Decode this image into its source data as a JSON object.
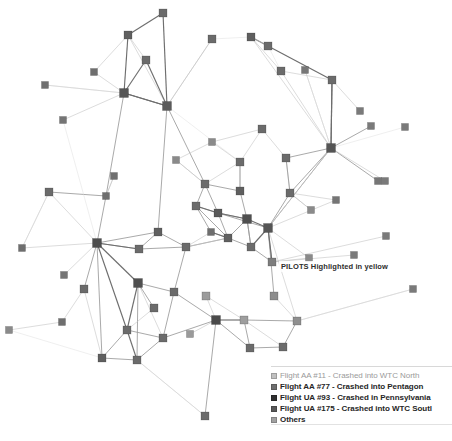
{
  "diagram": {
    "type": "node-link-network",
    "annotation": {
      "text": "PILOTS Highlighted in yellow",
      "x": 279,
      "y": 261
    },
    "node_shape": "square",
    "node_size": 7,
    "background": "#ffffff",
    "edge_colors": {
      "dark": "#6e6e6e",
      "medium": "#9a9a9a",
      "light": "#c4c4c4",
      "faint": "#dcdcdc"
    },
    "node_colors": {
      "aa11": "#b9b9b9",
      "aa77": "#6b6b6b",
      "ua93": "#3a3a3a",
      "ua175": "#555555",
      "others": "#a8a8a8",
      "pilot": "#7d7d7d"
    }
  },
  "legend": {
    "items": [
      {
        "label": "Flight AA #11 - Crashed into WTC North",
        "color": "#c0c0c0",
        "emphasis": "faint",
        "swatch_name": "legend-swatch-aa11"
      },
      {
        "label": "Flight AA #77 - Crashed into Pentagon",
        "color": "#6e6e6e",
        "emphasis": "bold",
        "swatch_name": "legend-swatch-aa77"
      },
      {
        "label": "Flight UA #93 - Crashed in Pennsylvania",
        "color": "#303030",
        "emphasis": "bold",
        "swatch_name": "legend-swatch-ua93"
      },
      {
        "label": "Flight UA #175 - Crashed into WTC Soutl",
        "color": "#585858",
        "emphasis": "bold",
        "swatch_name": "legend-swatch-ua175"
      },
      {
        "label": "Others",
        "color": "#a0a0a0",
        "emphasis": "bold",
        "swatch_name": "legend-swatch-others"
      }
    ]
  },
  "chart_data": {
    "type": "network",
    "nodes": [
      {
        "id": 0,
        "x": 163,
        "y": 13,
        "c": "#6b6b6b",
        "s": 8
      },
      {
        "id": 1,
        "x": 128,
        "y": 35,
        "c": "#5f5f5f",
        "s": 8
      },
      {
        "id": 2,
        "x": 146,
        "y": 60,
        "c": "#6b6b6b",
        "s": 8
      },
      {
        "id": 3,
        "x": 94,
        "y": 72,
        "c": "#6e6e6e",
        "s": 7
      },
      {
        "id": 4,
        "x": 124,
        "y": 93,
        "c": "#555555",
        "s": 9
      },
      {
        "id": 5,
        "x": 167,
        "y": 106,
        "c": "#5a5a5a",
        "s": 9
      },
      {
        "id": 6,
        "x": 45,
        "y": 85,
        "c": "#707070",
        "s": 7
      },
      {
        "id": 7,
        "x": 63,
        "y": 120,
        "c": "#757575",
        "s": 7
      },
      {
        "id": 8,
        "x": 212,
        "y": 39,
        "c": "#6b6b6b",
        "s": 8
      },
      {
        "id": 9,
        "x": 251,
        "y": 37,
        "c": "#5f5f5f",
        "s": 8
      },
      {
        "id": 10,
        "x": 268,
        "y": 46,
        "c": "#6b6b6b",
        "s": 8
      },
      {
        "id": 11,
        "x": 281,
        "y": 71,
        "c": "#6b6b6b",
        "s": 8
      },
      {
        "id": 12,
        "x": 305,
        "y": 70,
        "c": "#777777",
        "s": 7
      },
      {
        "id": 13,
        "x": 332,
        "y": 80,
        "c": "#6b6b6b",
        "s": 8
      },
      {
        "id": 14,
        "x": 331,
        "y": 148,
        "c": "#555555",
        "s": 9
      },
      {
        "id": 15,
        "x": 286,
        "y": 158,
        "c": "#6b6b6b",
        "s": 8
      },
      {
        "id": 16,
        "x": 371,
        "y": 126,
        "c": "#7a7a7a",
        "s": 7
      },
      {
        "id": 17,
        "x": 405,
        "y": 127,
        "c": "#7a7a7a",
        "s": 7
      },
      {
        "id": 18,
        "x": 378,
        "y": 181,
        "c": "#767676",
        "s": 7
      },
      {
        "id": 19,
        "x": 290,
        "y": 193,
        "c": "#6b6b6b",
        "s": 8
      },
      {
        "id": 20,
        "x": 336,
        "y": 200,
        "c": "#757575",
        "s": 7
      },
      {
        "id": 21,
        "x": 240,
        "y": 191,
        "c": "#5f5f5f",
        "s": 8
      },
      {
        "id": 22,
        "x": 205,
        "y": 184,
        "c": "#6b6b6b",
        "s": 8
      },
      {
        "id": 23,
        "x": 218,
        "y": 213,
        "c": "#5a5a5a",
        "s": 8
      },
      {
        "id": 24,
        "x": 196,
        "y": 206,
        "c": "#6b6b6b",
        "s": 8
      },
      {
        "id": 25,
        "x": 247,
        "y": 219,
        "c": "#4f4f4f",
        "s": 9
      },
      {
        "id": 26,
        "x": 268,
        "y": 228,
        "c": "#555555",
        "s": 9
      },
      {
        "id": 27,
        "x": 228,
        "y": 238,
        "c": "#606060",
        "s": 8
      },
      {
        "id": 28,
        "x": 251,
        "y": 247,
        "c": "#6b6b6b",
        "s": 8
      },
      {
        "id": 29,
        "x": 272,
        "y": 262,
        "c": "#7d7d7d",
        "s": 8
      },
      {
        "id": 30,
        "x": 211,
        "y": 232,
        "c": "#6e6e6e",
        "s": 7
      },
      {
        "id": 31,
        "x": 186,
        "y": 247,
        "c": "#6b6b6b",
        "s": 8
      },
      {
        "id": 32,
        "x": 158,
        "y": 232,
        "c": "#5f5f5f",
        "s": 8
      },
      {
        "id": 33,
        "x": 139,
        "y": 249,
        "c": "#6b6b6b",
        "s": 8
      },
      {
        "id": 34,
        "x": 106,
        "y": 196,
        "c": "#6e6e6e",
        "s": 7
      },
      {
        "id": 35,
        "x": 49,
        "y": 192,
        "c": "#6b6b6b",
        "s": 8
      },
      {
        "id": 36,
        "x": 22,
        "y": 248,
        "c": "#6e6e6e",
        "s": 7
      },
      {
        "id": 37,
        "x": 64,
        "y": 275,
        "c": "#757575",
        "s": 7
      },
      {
        "id": 38,
        "x": 97,
        "y": 243,
        "c": "#4d4d4d",
        "s": 9
      },
      {
        "id": 39,
        "x": 138,
        "y": 283,
        "c": "#4f4f4f",
        "s": 9
      },
      {
        "id": 40,
        "x": 174,
        "y": 292,
        "c": "#6b6b6b",
        "s": 8
      },
      {
        "id": 41,
        "x": 9,
        "y": 330,
        "c": "#8a8a8a",
        "s": 7
      },
      {
        "id": 42,
        "x": 127,
        "y": 330,
        "c": "#6b6b6b",
        "s": 8
      },
      {
        "id": 43,
        "x": 102,
        "y": 358,
        "c": "#5f5f5f",
        "s": 8
      },
      {
        "id": 44,
        "x": 137,
        "y": 360,
        "c": "#6b6b6b",
        "s": 8
      },
      {
        "id": 45,
        "x": 163,
        "y": 338,
        "c": "#6b6b6b",
        "s": 8
      },
      {
        "id": 46,
        "x": 206,
        "y": 296,
        "c": "#9c9c9c",
        "s": 8
      },
      {
        "id": 47,
        "x": 216,
        "y": 320,
        "c": "#4a4a4a",
        "s": 9
      },
      {
        "id": 48,
        "x": 244,
        "y": 320,
        "c": "#9e9e9e",
        "s": 8
      },
      {
        "id": 49,
        "x": 274,
        "y": 296,
        "c": "#8d8d8d",
        "s": 8
      },
      {
        "id": 50,
        "x": 250,
        "y": 348,
        "c": "#6b6b6b",
        "s": 8
      },
      {
        "id": 51,
        "x": 283,
        "y": 347,
        "c": "#6b6b6b",
        "s": 8
      },
      {
        "id": 52,
        "x": 297,
        "y": 321,
        "c": "#8f8f8f",
        "s": 8
      },
      {
        "id": 53,
        "x": 205,
        "y": 416,
        "c": "#6b6b6b",
        "s": 8
      },
      {
        "id": 54,
        "x": 154,
        "y": 308,
        "c": "#6b6b6b",
        "s": 8
      },
      {
        "id": 55,
        "x": 62,
        "y": 322,
        "c": "#6e6e6e",
        "s": 7
      },
      {
        "id": 56,
        "x": 114,
        "y": 176,
        "c": "#707070",
        "s": 7
      },
      {
        "id": 57,
        "x": 386,
        "y": 236,
        "c": "#7a7a7a",
        "s": 7
      },
      {
        "id": 58,
        "x": 354,
        "y": 255,
        "c": "#7a7a7a",
        "s": 7
      },
      {
        "id": 59,
        "x": 309,
        "y": 258,
        "c": "#8a8a8a",
        "s": 7
      },
      {
        "id": 60,
        "x": 413,
        "y": 289,
        "c": "#7a7a7a",
        "s": 7
      },
      {
        "id": 61,
        "x": 385,
        "y": 181,
        "c": "#7a7a7a",
        "s": 7
      },
      {
        "id": 62,
        "x": 240,
        "y": 162,
        "c": "#6b6b6b",
        "s": 8
      },
      {
        "id": 63,
        "x": 262,
        "y": 129,
        "c": "#6b6b6b",
        "s": 8
      },
      {
        "id": 64,
        "x": 212,
        "y": 142,
        "c": "#8a8a8a",
        "s": 7
      },
      {
        "id": 65,
        "x": 176,
        "y": 160,
        "c": "#8a8a8a",
        "s": 7
      },
      {
        "id": 66,
        "x": 84,
        "y": 289,
        "c": "#6b6b6b",
        "s": 8
      },
      {
        "id": 67,
        "x": 190,
        "y": 334,
        "c": "#9a9a9a",
        "s": 7
      },
      {
        "id": 68,
        "x": 311,
        "y": 210,
        "c": "#8a8a8a",
        "s": 7
      },
      {
        "id": 69,
        "x": 360,
        "y": 111,
        "c": "#7a7a7a",
        "s": 7
      }
    ],
    "edges": [
      [
        0,
        1,
        "dark"
      ],
      [
        0,
        5,
        "dark"
      ],
      [
        1,
        2,
        "light"
      ],
      [
        1,
        3,
        "light"
      ],
      [
        1,
        4,
        "dark"
      ],
      [
        1,
        5,
        "light"
      ],
      [
        2,
        4,
        "dark"
      ],
      [
        2,
        5,
        "dark"
      ],
      [
        3,
        4,
        "light"
      ],
      [
        4,
        5,
        "dark"
      ],
      [
        4,
        6,
        "light"
      ],
      [
        4,
        7,
        "light"
      ],
      [
        6,
        4,
        "faint"
      ],
      [
        4,
        34,
        "medium"
      ],
      [
        5,
        32,
        "medium"
      ],
      [
        5,
        4,
        "dark"
      ],
      [
        5,
        22,
        "medium"
      ],
      [
        5,
        8,
        "light"
      ],
      [
        8,
        9,
        "faint"
      ],
      [
        8,
        5,
        "light"
      ],
      [
        9,
        11,
        "light"
      ],
      [
        9,
        13,
        "dark"
      ],
      [
        10,
        11,
        "faint"
      ],
      [
        11,
        13,
        "light"
      ],
      [
        11,
        14,
        "light"
      ],
      [
        12,
        14,
        "light"
      ],
      [
        13,
        14,
        "dark"
      ],
      [
        13,
        69,
        "light"
      ],
      [
        14,
        16,
        "medium"
      ],
      [
        14,
        17,
        "faint"
      ],
      [
        14,
        18,
        "medium"
      ],
      [
        14,
        15,
        "medium"
      ],
      [
        14,
        19,
        "medium"
      ],
      [
        14,
        61,
        "light"
      ],
      [
        14,
        9,
        "light"
      ],
      [
        14,
        13,
        "dark"
      ],
      [
        14,
        26,
        "medium"
      ],
      [
        15,
        19,
        "light"
      ],
      [
        15,
        63,
        "light"
      ],
      [
        19,
        20,
        "light"
      ],
      [
        19,
        26,
        "medium"
      ],
      [
        19,
        68,
        "light"
      ],
      [
        20,
        26,
        "light"
      ],
      [
        21,
        22,
        "medium"
      ],
      [
        21,
        25,
        "medium"
      ],
      [
        21,
        62,
        "light"
      ],
      [
        22,
        23,
        "medium"
      ],
      [
        22,
        24,
        "medium"
      ],
      [
        22,
        65,
        "light"
      ],
      [
        23,
        24,
        "medium"
      ],
      [
        23,
        25,
        "medium"
      ],
      [
        23,
        26,
        "medium"
      ],
      [
        23,
        27,
        "medium"
      ],
      [
        24,
        27,
        "medium"
      ],
      [
        24,
        30,
        "medium"
      ],
      [
        25,
        26,
        "dark"
      ],
      [
        25,
        27,
        "medium"
      ],
      [
        25,
        28,
        "medium"
      ],
      [
        26,
        28,
        "dark"
      ],
      [
        26,
        29,
        "medium"
      ],
      [
        26,
        59,
        "light"
      ],
      [
        26,
        49,
        "medium"
      ],
      [
        26,
        52,
        "light"
      ],
      [
        27,
        28,
        "medium"
      ],
      [
        27,
        30,
        "medium"
      ],
      [
        27,
        31,
        "medium"
      ],
      [
        28,
        29,
        "medium"
      ],
      [
        29,
        58,
        "light"
      ],
      [
        29,
        57,
        "light"
      ],
      [
        29,
        59,
        "light"
      ],
      [
        30,
        31,
        "light"
      ],
      [
        31,
        32,
        "medium"
      ],
      [
        31,
        33,
        "medium"
      ],
      [
        31,
        40,
        "medium"
      ],
      [
        32,
        33,
        "medium"
      ],
      [
        32,
        38,
        "medium"
      ],
      [
        33,
        38,
        "medium"
      ],
      [
        34,
        35,
        "medium"
      ],
      [
        34,
        38,
        "medium"
      ],
      [
        34,
        56,
        "light"
      ],
      [
        35,
        36,
        "light"
      ],
      [
        35,
        38,
        "light"
      ],
      [
        36,
        38,
        "light"
      ],
      [
        37,
        38,
        "light"
      ],
      [
        38,
        39,
        "dark"
      ],
      [
        38,
        42,
        "dark"
      ],
      [
        38,
        66,
        "medium"
      ],
      [
        38,
        33,
        "dark"
      ],
      [
        38,
        43,
        "medium"
      ],
      [
        39,
        42,
        "dark"
      ],
      [
        39,
        40,
        "medium"
      ],
      [
        39,
        44,
        "medium"
      ],
      [
        39,
        45,
        "light"
      ],
      [
        40,
        45,
        "medium"
      ],
      [
        40,
        47,
        "medium"
      ],
      [
        41,
        55,
        "light"
      ],
      [
        42,
        43,
        "medium"
      ],
      [
        42,
        44,
        "dark"
      ],
      [
        42,
        45,
        "medium"
      ],
      [
        43,
        44,
        "medium"
      ],
      [
        44,
        45,
        "medium"
      ],
      [
        44,
        53,
        "light"
      ],
      [
        45,
        47,
        "medium"
      ],
      [
        46,
        47,
        "light"
      ],
      [
        46,
        48,
        "light"
      ],
      [
        47,
        48,
        "dark"
      ],
      [
        47,
        50,
        "medium"
      ],
      [
        47,
        53,
        "medium"
      ],
      [
        48,
        50,
        "medium"
      ],
      [
        48,
        51,
        "light"
      ],
      [
        48,
        52,
        "medium"
      ],
      [
        49,
        52,
        "light"
      ],
      [
        50,
        51,
        "medium"
      ],
      [
        51,
        52,
        "medium"
      ],
      [
        52,
        60,
        "light"
      ],
      [
        54,
        39,
        "medium"
      ],
      [
        54,
        42,
        "light"
      ],
      [
        55,
        66,
        "light"
      ],
      [
        56,
        34,
        "light"
      ],
      [
        62,
        63,
        "light"
      ],
      [
        62,
        64,
        "light"
      ],
      [
        62,
        21,
        "medium"
      ],
      [
        63,
        64,
        "light"
      ],
      [
        64,
        65,
        "light"
      ],
      [
        65,
        22,
        "light"
      ],
      [
        66,
        43,
        "light"
      ],
      [
        67,
        47,
        "light"
      ],
      [
        68,
        19,
        "light"
      ],
      [
        5,
        62,
        "faint"
      ],
      [
        7,
        38,
        "faint"
      ],
      [
        31,
        27,
        "light"
      ],
      [
        26,
        14,
        "light"
      ],
      [
        29,
        26,
        "dark"
      ],
      [
        25,
        23,
        "dark"
      ],
      [
        28,
        25,
        "medium"
      ],
      [
        22,
        62,
        "light"
      ],
      [
        24,
        23,
        "dark"
      ],
      [
        30,
        27,
        "dark"
      ],
      [
        19,
        15,
        "medium"
      ],
      [
        14,
        12,
        "faint"
      ],
      [
        9,
        10,
        "faint"
      ],
      [
        53,
        44,
        "faint"
      ],
      [
        41,
        43,
        "faint"
      ],
      [
        36,
        35,
        "faint"
      ],
      [
        60,
        52,
        "faint"
      ]
    ]
  }
}
